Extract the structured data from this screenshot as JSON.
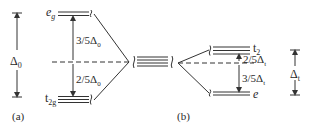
{
  "diagram": {
    "left": {
      "panel_label": "(a)",
      "upper_level": {
        "name": "e",
        "sub": "g"
      },
      "lower_level": {
        "name": "t",
        "sub": "2g"
      },
      "upper_gap": {
        "text": "3/5Δ",
        "sub": "0"
      },
      "lower_gap": {
        "text": "2/5Δ",
        "sub": "0"
      },
      "splitting": {
        "text": "Δ",
        "sub": "0"
      }
    },
    "right": {
      "panel_label": "(b)",
      "upper_level": {
        "name": "t",
        "sub": "2"
      },
      "lower_level": {
        "name": "e",
        "sub": ""
      },
      "upper_gap": {
        "text": "2/5Δ",
        "sub": "t"
      },
      "lower_gap": {
        "text": "3/5Δ",
        "sub": "t"
      },
      "splitting": {
        "text": "Δ",
        "sub": "t"
      }
    },
    "colors": {
      "line": "#333333",
      "text": "#2a2a2a"
    }
  }
}
